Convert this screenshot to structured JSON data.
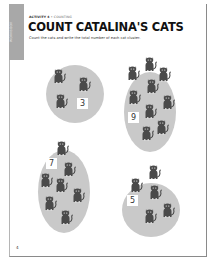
{
  "side_tab": {
    "label": "WORKBOOK"
  },
  "header": {
    "activity_label": "ACTIVITY 4",
    "separator": " • ",
    "category": "COUNTING",
    "title": "COUNT CATALINA'S CATS",
    "instructions": "Count the cats and write the total number of each cat cluster."
  },
  "clusters": [
    {
      "id": "cluster-1",
      "shape": "circle",
      "cat_count": 3,
      "answer": "3"
    },
    {
      "id": "cluster-2",
      "shape": "oval",
      "cat_count": 9,
      "answer": "9"
    },
    {
      "id": "cluster-3",
      "shape": "oval",
      "cat_count": 7,
      "answer": "7"
    },
    {
      "id": "cluster-4",
      "shape": "circle",
      "cat_count": 5,
      "answer": "5"
    }
  ],
  "icons": {
    "cat": "cat-icon"
  },
  "colors": {
    "cluster_fill": "#c9c9c9",
    "cat_fill": "#4a4a4a",
    "side_tab": "#a8a8a8"
  },
  "footer": {
    "page_number": "4"
  }
}
